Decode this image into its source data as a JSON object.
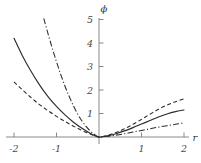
{
  "chart_data": {
    "type": "line",
    "title": "",
    "xlabel": "r",
    "ylabel": "ϕ",
    "xlim": [
      -2.2,
      2.2
    ],
    "ylim": [
      -0.25,
      5.3
    ],
    "grid": false,
    "legend": "none",
    "xticks": [
      -2,
      -1,
      1,
      2
    ],
    "xtick_labels": [
      "-2",
      "-1",
      "1",
      "2"
    ],
    "yticks": [
      1,
      2,
      3,
      4,
      5
    ],
    "ytick_labels": [
      "1",
      "2",
      "3",
      "4",
      "5"
    ],
    "series": [
      {
        "name": "solid",
        "style": "solid",
        "color": "#2b2b2b",
        "x": [
          -2.0,
          -1.8,
          -1.6,
          -1.4,
          -1.2,
          -1.0,
          -0.8,
          -0.6,
          -0.4,
          -0.2,
          0.0,
          0.2,
          0.4,
          0.6,
          0.8,
          1.0,
          1.2,
          1.4,
          1.6,
          1.8,
          2.0
        ],
        "y": [
          4.2,
          3.45,
          2.8,
          2.22,
          1.72,
          1.3,
          0.94,
          0.63,
          0.37,
          0.15,
          0.0,
          0.05,
          0.14,
          0.26,
          0.4,
          0.55,
          0.7,
          0.85,
          0.98,
          1.08,
          1.15
        ]
      },
      {
        "name": "dash-dot",
        "style": "dashdot",
        "color": "#2b2b2b",
        "x": [
          -1.3,
          -1.2,
          -1.1,
          -1.0,
          -0.9,
          -0.8,
          -0.7,
          -0.6,
          -0.5,
          -0.4,
          -0.3,
          -0.2,
          -0.1,
          0.0,
          0.2,
          0.4,
          0.6,
          0.8,
          1.0,
          1.2,
          1.4,
          1.6,
          1.8,
          2.0
        ],
        "y": [
          5.05,
          4.4,
          3.78,
          3.2,
          2.66,
          2.16,
          1.72,
          1.32,
          0.97,
          0.68,
          0.44,
          0.25,
          0.1,
          0.0,
          0.03,
          0.08,
          0.14,
          0.21,
          0.28,
          0.35,
          0.42,
          0.48,
          0.54,
          0.6
        ]
      },
      {
        "name": "dashed",
        "style": "dashed",
        "color": "#2b2b2b",
        "x": [
          -2.0,
          -1.8,
          -1.6,
          -1.4,
          -1.2,
          -1.0,
          -0.8,
          -0.6,
          -0.4,
          -0.2,
          0.0,
          0.2,
          0.4,
          0.6,
          0.8,
          1.0,
          1.2,
          1.4,
          1.6,
          1.8,
          2.0
        ],
        "y": [
          2.35,
          2.0,
          1.68,
          1.38,
          1.12,
          0.88,
          0.66,
          0.46,
          0.28,
          0.12,
          0.0,
          0.07,
          0.19,
          0.35,
          0.54,
          0.75,
          0.97,
          1.18,
          1.36,
          1.5,
          1.62
        ]
      }
    ]
  }
}
